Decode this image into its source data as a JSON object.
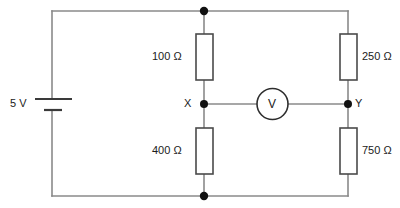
{
  "diagram": {
    "type": "circuit-schematic",
    "width": 400,
    "height": 208,
    "colors": {
      "background": "#ffffff",
      "wire": "#8a8a8a",
      "component_outline": "#4a4a4a",
      "node_dot": "#111111",
      "text": "#1b1b1b"
    }
  },
  "source": {
    "name": "battery",
    "label": "5 V",
    "voltage_value": 5,
    "voltage_unit": "V"
  },
  "resistors": [
    {
      "id": "r-top-left",
      "label": "100 Ω",
      "value": 100,
      "unit": "Ω",
      "branch": "left",
      "position": "top",
      "label_side": "left"
    },
    {
      "id": "r-bottom-left",
      "label": "400 Ω",
      "value": 400,
      "unit": "Ω",
      "branch": "left",
      "position": "bottom",
      "label_side": "left"
    },
    {
      "id": "r-top-right",
      "label": "250 Ω",
      "value": 250,
      "unit": "Ω",
      "branch": "right",
      "position": "top",
      "label_side": "right"
    },
    {
      "id": "r-bottom-right",
      "label": "750 Ω",
      "value": 750,
      "unit": "Ω",
      "branch": "right",
      "position": "bottom",
      "label_side": "right"
    }
  ],
  "meter": {
    "name": "voltmeter",
    "symbol": "V",
    "connects_from": "X",
    "connects_to": "Y"
  },
  "nodes": [
    {
      "id": "node-x",
      "label": "X",
      "label_side": "left"
    },
    {
      "id": "node-y",
      "label": "Y",
      "label_side": "right"
    },
    {
      "id": "node-top",
      "label": "",
      "label_side": "none"
    },
    {
      "id": "node-bottom",
      "label": "",
      "label_side": "none"
    }
  ]
}
